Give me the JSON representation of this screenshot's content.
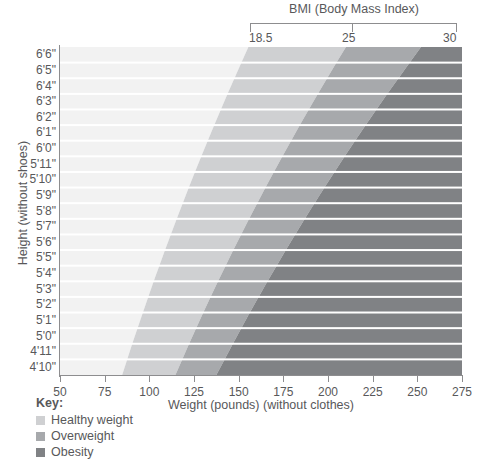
{
  "chart_data": {
    "type": "heatmap",
    "title": "BMI (Body Mass Index)",
    "xlabel": "Weight (pounds) (without clothes)",
    "ylabel": "Height (without shoes)",
    "xlim": [
      50,
      275
    ],
    "ylim_labels": [
      "4'10\"",
      "6'6\""
    ],
    "xticks": [
      50,
      75,
      100,
      125,
      150,
      175,
      200,
      225,
      250,
      275
    ],
    "xtick_labels": [
      "50",
      "75",
      "100",
      "125",
      "150",
      "175",
      "200",
      "225",
      "250",
      "275"
    ],
    "ytick_labels": [
      "6'6\"",
      "6'5\"",
      "6'4\"",
      "6'3\"",
      "6'2\"",
      "6'1\"",
      "6'0\"",
      "5'11\"",
      "5'10\"",
      "5'9\"",
      "5'8\"",
      "5'7\"",
      "5'6\"",
      "5'5\"",
      "5'4\"",
      "5'3\"",
      "5'2\"",
      "5'1\"",
      "5'0\"",
      "4'11\"",
      "4'10\""
    ],
    "height_inches": [
      78,
      77,
      76,
      75,
      74,
      73,
      72,
      71,
      70,
      69,
      68,
      67,
      66,
      65,
      64,
      63,
      62,
      61,
      60,
      59,
      58
    ],
    "bmi_thresholds": [
      18.5,
      25,
      30
    ],
    "bmi_tick_labels": [
      "18.5",
      "25",
      "30"
    ],
    "grid": true,
    "legend_position": "bottom-left",
    "bands": [
      {
        "name": "Underweight",
        "bmi_range": [
          0,
          18.5
        ],
        "color": "#f2f2f2",
        "in_key": false
      },
      {
        "name": "Healthy weight",
        "bmi_range": [
          18.5,
          25
        ],
        "color": "#cfd0d2",
        "in_key": true
      },
      {
        "name": "Overweight",
        "bmi_range": [
          25,
          30
        ],
        "color": "#a7a9ac",
        "in_key": true
      },
      {
        "name": "Obesity",
        "bmi_range": [
          30,
          60
        ],
        "color": "#808285",
        "in_key": true
      }
    ],
    "boundary_weights_lbs": {
      "bmi_18_5": [
        153.5,
        149.6,
        145.7,
        141.9,
        138.2,
        134.5,
        130.9,
        127.3,
        123.8,
        120.4,
        117.0,
        113.7,
        110.4,
        107.2,
        104.0,
        100.9,
        97.9,
        94.9,
        91.9,
        89.0,
        86.2
      ],
      "bmi_25": [
        207.4,
        202.1,
        196.9,
        191.8,
        186.7,
        181.8,
        176.9,
        172.1,
        167.3,
        162.7,
        158.1,
        153.6,
        149.2,
        144.8,
        140.6,
        136.3,
        132.2,
        128.2,
        124.2,
        120.3,
        116.5
      ],
      "bmi_30": [
        248.9,
        242.6,
        236.3,
        230.1,
        224.1,
        218.1,
        212.2,
        206.5,
        200.8,
        195.2,
        189.7,
        184.3,
        179.0,
        173.8,
        168.7,
        163.6,
        158.7,
        153.8,
        149.1,
        144.4,
        139.8
      ]
    }
  },
  "header": {
    "bmi_title": "BMI (Body Mass Index)",
    "tick_18_5": "18.5",
    "tick_25": "25",
    "tick_30": "30"
  },
  "axes": {
    "y_title": "Height (without shoes)",
    "x_title": "Weight (pounds) (without clothes)"
  },
  "key": {
    "title": "Key:",
    "items": [
      {
        "label": "Healthy weight",
        "color": "#cfd0d2"
      },
      {
        "label": "Overweight",
        "color": "#a7a9ac"
      },
      {
        "label": "Obesity",
        "color": "#808285"
      }
    ]
  }
}
